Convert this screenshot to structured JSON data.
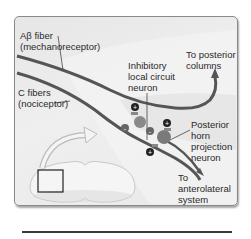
{
  "diagram": {
    "labels": {
      "abeta_fiber": "Aβ fiber",
      "abeta_role": "(mechanoreceptor)",
      "c_fibers": "C fibers",
      "c_role": "(nociceptor)",
      "inhibitory_1": "Inhibitory",
      "inhibitory_2": "local circuit",
      "inhibitory_3": "neuron",
      "posterior_cols_1": "To posterior",
      "posterior_cols_2": "columns",
      "projection_1": "Posterior",
      "projection_2": "horn",
      "projection_3": "projection",
      "projection_4": "neuron",
      "anterolateral_1": "To",
      "anterolateral_2": "anterolateral",
      "anterolateral_3": "system"
    },
    "synapse_signs": [
      "+",
      "+",
      "-",
      "+",
      "-",
      "+"
    ],
    "colors": {
      "fiber": "#555555",
      "neuron_body": "#7a7a7a",
      "background": "#eaeaea",
      "frame_border": "#8a8a8a"
    }
  }
}
